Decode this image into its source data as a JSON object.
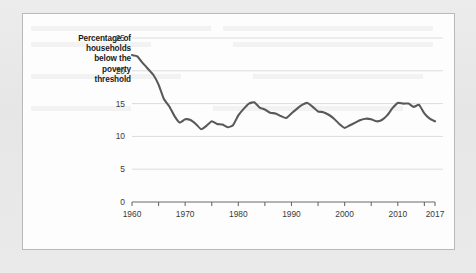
{
  "figure": {
    "axis_label_lines": [
      "Percentage of",
      "households",
      "below the",
      "poverty",
      "threshold"
    ]
  },
  "chart_data": {
    "type": "line",
    "title": "",
    "subtitle": "",
    "xlabel": "",
    "ylabel": "Percentage of households below the poverty threshold",
    "xlim": [
      1960,
      2017
    ],
    "ylim": [
      0,
      25
    ],
    "grid": true,
    "grid_axis": "y",
    "legend": "none",
    "line_color": "#58595b",
    "y_ticks": [
      0,
      5,
      10,
      15,
      20,
      25
    ],
    "y_tick_labels": [
      "0",
      "5",
      "10",
      "15",
      "20",
      "25"
    ],
    "x_ticks": [
      1960,
      1965,
      1970,
      1975,
      1980,
      1985,
      1990,
      1995,
      2000,
      2005,
      2010,
      2015,
      2017
    ],
    "x_tick_labels": [
      "1960",
      "",
      "1970",
      "",
      "1980",
      "",
      "1990",
      "",
      "2000",
      "",
      "2010",
      "",
      "2017"
    ],
    "x_labeled_ticks": [
      1960,
      1970,
      1980,
      1990,
      2000,
      2010,
      2017
    ],
    "series": [
      {
        "name": "Percentage of households below the poverty threshold",
        "x": [
          1960,
          1961,
          1962,
          1963,
          1964,
          1965,
          1966,
          1967,
          1968,
          1969,
          1970,
          1971,
          1972,
          1973,
          1974,
          1975,
          1976,
          1977,
          1978,
          1979,
          1980,
          1981,
          1982,
          1983,
          1984,
          1985,
          1986,
          1987,
          1988,
          1989,
          1990,
          1991,
          1992,
          1993,
          1994,
          1995,
          1996,
          1997,
          1998,
          1999,
          2000,
          2001,
          2002,
          2003,
          2004,
          2005,
          2006,
          2007,
          2008,
          2009,
          2010,
          2011,
          2012,
          2013,
          2014,
          2015,
          2016,
          2017
        ],
        "values": [
          22.4,
          22.2,
          21.2,
          20.3,
          19.4,
          17.9,
          15.7,
          14.6,
          13.1,
          12.1,
          12.6,
          12.5,
          11.9,
          11.1,
          11.6,
          12.3,
          11.9,
          11.8,
          11.4,
          11.7,
          13.2,
          14.2,
          15.0,
          15.2,
          14.4,
          14.1,
          13.6,
          13.5,
          13.1,
          12.8,
          13.5,
          14.2,
          14.8,
          15.1,
          14.5,
          13.8,
          13.7,
          13.3,
          12.7,
          11.9,
          11.3,
          11.7,
          12.1,
          12.5,
          12.7,
          12.6,
          12.3,
          12.5,
          13.2,
          14.3,
          15.1,
          15.0,
          15.0,
          14.5,
          14.8,
          13.5,
          12.7,
          12.3
        ]
      }
    ]
  }
}
